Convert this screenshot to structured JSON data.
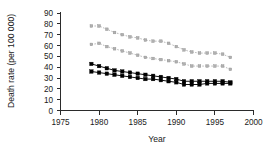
{
  "chart_data": {
    "type": "line",
    "title": "",
    "xlabel": "Year",
    "ylabel": "Death rate (per 100 000)",
    "xlim": [
      1975,
      2000
    ],
    "ylim": [
      0,
      90
    ],
    "xticks": [
      1975,
      1980,
      1985,
      1990,
      1995,
      2000
    ],
    "yticks": [
      0,
      10,
      20,
      30,
      40,
      50,
      60,
      70,
      80,
      90
    ],
    "grid": false,
    "legend": "none",
    "x": [
      1979,
      1980,
      1981,
      1982,
      1983,
      1984,
      1985,
      1986,
      1987,
      1988,
      1989,
      1990,
      1991,
      1992,
      1993,
      1994,
      1995,
      1996,
      1997
    ],
    "series": [
      {
        "name": "gray-upper",
        "marker": "square",
        "color": "#b0b0b0",
        "style": "dotted",
        "values": [
          78,
          78,
          75,
          72,
          70,
          68,
          67,
          65,
          64,
          64,
          62,
          59,
          56,
          54,
          53,
          53,
          53,
          52,
          49
        ]
      },
      {
        "name": "gray-lower",
        "marker": "square",
        "color": "#b0b0b0",
        "style": "dotted",
        "values": [
          61,
          62,
          59,
          57,
          55,
          53,
          51,
          49,
          48,
          47,
          46,
          45,
          43,
          41,
          41,
          41,
          41,
          41,
          38
        ]
      },
      {
        "name": "black-upper",
        "marker": "square",
        "color": "#000000",
        "style": "solid",
        "values": [
          43,
          41,
          39,
          37,
          36,
          35,
          34,
          33,
          32,
          31,
          30,
          29,
          27,
          27,
          27,
          27,
          27,
          27,
          26
        ]
      },
      {
        "name": "black-lower",
        "marker": "square",
        "color": "#000000",
        "style": "solid",
        "values": [
          36,
          35,
          34,
          33,
          32,
          31,
          30,
          29,
          29,
          28,
          27,
          26,
          24,
          24,
          24,
          25,
          25,
          25,
          25
        ]
      }
    ]
  }
}
